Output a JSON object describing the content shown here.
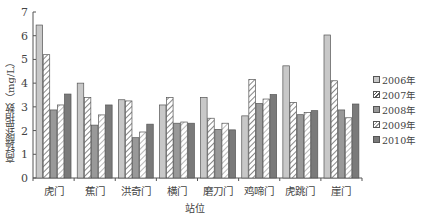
{
  "chart_data": {
    "type": "bar",
    "title": "",
    "xlabel": "站位",
    "ylabel": "高锰酸盐指数（mg/L）",
    "ylim": [
      0,
      7
    ],
    "yticks": [
      0,
      1,
      2,
      3,
      4,
      5,
      6,
      7
    ],
    "grid": false,
    "legend_position": "right",
    "categories": [
      "虎门",
      "蕉门",
      "洪奇门",
      "横门",
      "磨刀门",
      "鸡啼门",
      "虎跳门",
      "崖门"
    ],
    "series": [
      {
        "name": "2006年",
        "fill": "#c8c8c8",
        "pattern": "solid",
        "values": [
          6.45,
          4.0,
          3.3,
          3.08,
          3.4,
          2.62,
          4.73,
          6.03
        ]
      },
      {
        "name": "2007年",
        "fill": "#ffffff",
        "pattern": "hatch",
        "values": [
          5.2,
          3.39,
          3.25,
          3.39,
          2.52,
          4.16,
          3.19,
          4.1
        ]
      },
      {
        "name": "2008年",
        "fill": "#999999",
        "pattern": "solid",
        "values": [
          2.87,
          2.23,
          1.7,
          2.31,
          2.05,
          3.14,
          2.67,
          2.87
        ]
      },
      {
        "name": "2009年",
        "fill": "#ffffff",
        "pattern": "hatch-light",
        "values": [
          3.08,
          2.66,
          1.94,
          2.36,
          2.31,
          3.33,
          2.76,
          2.54
        ]
      },
      {
        "name": "2010年",
        "fill": "#7a7a7a",
        "pattern": "solid",
        "values": [
          3.54,
          3.08,
          2.27,
          2.31,
          2.03,
          3.52,
          2.84,
          3.12
        ]
      }
    ]
  },
  "labels": {
    "xlabel": "站位",
    "ylabel": "高锰酸盐指数（mg/L）"
  },
  "legend": [
    {
      "label": "2006年"
    },
    {
      "label": "2007年"
    },
    {
      "label": "2008年"
    },
    {
      "label": "2009年"
    },
    {
      "label": "2010年"
    }
  ]
}
